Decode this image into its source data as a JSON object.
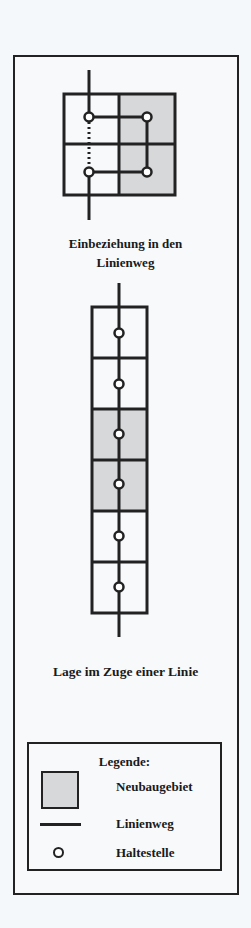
{
  "diagram_top": {
    "caption_line1": "Einbeziehung in den",
    "caption_line2": "Linienweg"
  },
  "diagram_bottom": {
    "caption": "Lage im Zuge einer Linie"
  },
  "legend": {
    "title": "Legende:",
    "items": [
      {
        "symbol": "shaded-square",
        "label": "Neubaugebiet"
      },
      {
        "symbol": "line",
        "label": "Linienweg"
      },
      {
        "symbol": "circle",
        "label": "Haltestelle"
      }
    ]
  },
  "colors": {
    "line": "#222222",
    "shaded_area": "#d6d8da",
    "background": "#f5f8fb"
  }
}
